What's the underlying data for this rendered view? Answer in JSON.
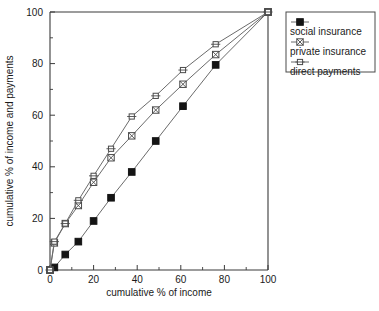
{
  "chart_data": {
    "type": "line",
    "title": "",
    "xlabel": "cumulative % of income",
    "ylabel": "cumulative % of income and payments",
    "xlim": [
      0,
      100
    ],
    "ylim": [
      0,
      100
    ],
    "xticks": [
      0,
      20,
      40,
      60,
      80,
      100
    ],
    "yticks": [
      0,
      20,
      40,
      60,
      80,
      100
    ],
    "xticklabels": [
      "0",
      "20",
      "40",
      "60",
      "80",
      "100"
    ],
    "yticklabels": [
      "0",
      "20",
      "40",
      "60",
      "80",
      "100"
    ],
    "minor_ticks_x": [
      10,
      30,
      50,
      70,
      90
    ],
    "minor_ticks_y": [
      10,
      30,
      50,
      70,
      90
    ],
    "grid": false,
    "legend_position": "outside top-right",
    "series": [
      {
        "name": "social insurance",
        "marker": "filled-square",
        "x": [
          0,
          2,
          7,
          13,
          20,
          28,
          37.5,
          48.5,
          61,
          76,
          100
        ],
        "y": [
          0,
          1,
          6,
          11,
          19,
          28,
          38,
          50,
          63.5,
          79.5,
          100
        ]
      },
      {
        "name": "private insurance",
        "marker": "crossed-square",
        "x": [
          0,
          2,
          7,
          13,
          20,
          28,
          37.5,
          48.5,
          61,
          76,
          100
        ],
        "y": [
          0,
          10.5,
          18,
          25,
          34,
          43.5,
          52,
          62,
          72,
          83.5,
          100
        ]
      },
      {
        "name": "direct payments",
        "marker": "open-square",
        "x": [
          0,
          2,
          7,
          13,
          20,
          28,
          37.5,
          48.5,
          61,
          76,
          100
        ],
        "y": [
          0,
          11,
          18,
          27,
          36.5,
          47,
          59.5,
          67.5,
          77.5,
          87.5,
          100
        ]
      }
    ]
  },
  "legend": {
    "entries": [
      {
        "label": "social insurance",
        "marker": "filled-square"
      },
      {
        "label": "private insurance",
        "marker": "crossed-square"
      },
      {
        "label": "direct payments",
        "marker": "open-square"
      }
    ]
  },
  "axes": {
    "x_title": "cumulative % of income",
    "y_title": "cumulative % of income and payments"
  },
  "colors": {
    "line": "#6b6b6b",
    "axis": "#3a3a3a",
    "marker_fill": "#141414",
    "marker_open": "#ffffff",
    "background": "#ffffff",
    "text": "#1a1a1a"
  }
}
